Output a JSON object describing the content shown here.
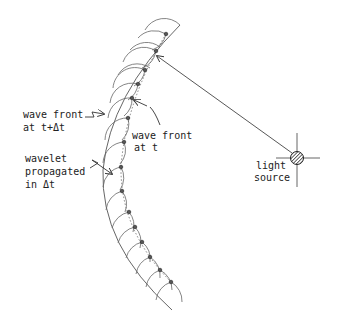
{
  "labels": {
    "outer_front_line1": "wave front",
    "outer_front_line2": "at  t+Δt",
    "inner_front_line1": "wave front",
    "inner_front_line2": "at t",
    "wavelet_line1": "wavelet",
    "wavelet_line2": "propagated",
    "wavelet_line3": "in Δt",
    "source_line1": "light",
    "source_line2": "source"
  },
  "diagram": {
    "source": {
      "cx": 297,
      "cy": 158,
      "r": 6
    },
    "inner_front_points": [
      [
        166,
        34
      ],
      [
        156,
        51
      ],
      [
        145,
        70
      ],
      [
        138,
        84
      ],
      [
        132,
        98
      ],
      [
        128,
        118
      ],
      [
        124,
        142
      ],
      [
        121,
        167
      ],
      [
        122,
        191
      ],
      [
        129,
        212
      ],
      [
        135,
        227
      ],
      [
        142,
        242
      ],
      [
        150,
        257
      ],
      [
        160,
        270
      ],
      [
        171,
        282
      ]
    ],
    "wavelet_radius": 22,
    "colors": {
      "stroke": "#555555",
      "text": "#222222",
      "background": "#ffffff"
    }
  }
}
